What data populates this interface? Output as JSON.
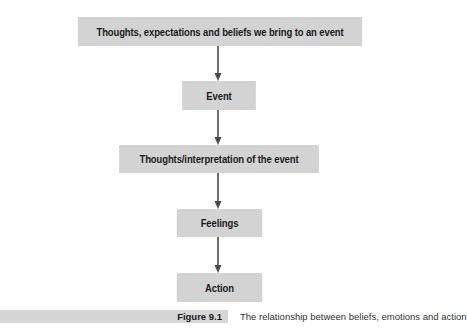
{
  "diagram": {
    "type": "flowchart",
    "direction": "top-to-bottom",
    "nodes": [
      {
        "id": "beliefs",
        "label": "Thoughts, expectations and beliefs we bring to an event"
      },
      {
        "id": "event",
        "label": "Event"
      },
      {
        "id": "interpretation",
        "label": "Thoughts/interpretation of the event"
      },
      {
        "id": "feelings",
        "label": "Feelings"
      },
      {
        "id": "action",
        "label": "Action"
      }
    ],
    "edges": [
      {
        "from": "beliefs",
        "to": "event"
      },
      {
        "from": "event",
        "to": "interpretation"
      },
      {
        "from": "interpretation",
        "to": "feelings"
      },
      {
        "from": "feelings",
        "to": "action"
      }
    ]
  },
  "caption": {
    "figure_number": "Figure 9.1",
    "text": "The relationship between beliefs, emotions and action"
  },
  "colors": {
    "box_fill": "#d3d3d3",
    "arrow": "#4a4a4a",
    "text": "#1a1a1a"
  }
}
